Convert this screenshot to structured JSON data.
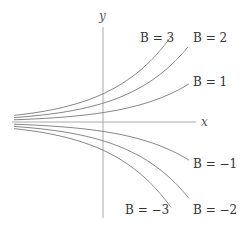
{
  "chart_data": {
    "type": "line",
    "title": "",
    "xlabel": "x",
    "ylabel": "y",
    "grid": false,
    "legend": "inline labels at curve ends",
    "function": "y = B e^{kx}",
    "series": [
      {
        "name": "B = 3",
        "B": 3,
        "label_x": 140,
        "label_y": 42,
        "end_x": 171
      },
      {
        "name": "B = 2",
        "B": 2,
        "label_x": 193,
        "label_y": 42,
        "end_x": 188
      },
      {
        "name": "B = 1",
        "B": 1,
        "label_x": 193,
        "label_y": 86,
        "end_x": 189
      },
      {
        "name": "B = −1",
        "B": -1,
        "label_x": 193,
        "label_y": 168,
        "end_x": 189
      },
      {
        "name": "B = −2",
        "B": -2,
        "label_x": 193,
        "label_y": 214,
        "end_x": 189
      },
      {
        "name": "B = −3",
        "B": -3,
        "label_x": 125,
        "label_y": 214,
        "end_x": 171
      }
    ]
  },
  "colors": {
    "axis": "#aaaaaa",
    "curve": "#888888",
    "text": "#333333"
  }
}
